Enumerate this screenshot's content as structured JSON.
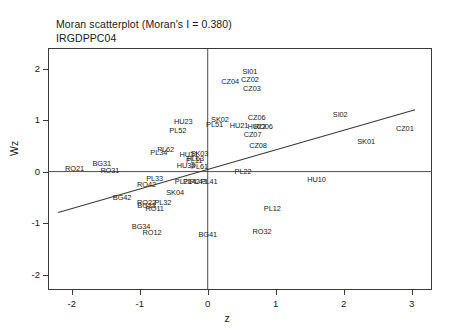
{
  "title": {
    "main": "Moran scatterplot (Moran's I = 0.380)",
    "sub": "IRGDPPC04"
  },
  "axes": {
    "xlabel": "z",
    "ylabel": "Wz",
    "xticks": [
      "-2",
      "-1",
      "0",
      "1",
      "2",
      "3"
    ],
    "yticks": [
      "-2",
      "-1",
      "0",
      "1",
      "2"
    ],
    "xlim": [
      -2.35,
      3.3
    ],
    "ylim": [
      -2.3,
      2.4
    ]
  },
  "chart_data": {
    "type": "scatter",
    "title": "Moran scatterplot (Moran's I = 0.380)",
    "subtitle": "IRGDPPC04",
    "xlabel": "z",
    "ylabel": "Wz",
    "xlim": [
      -2.35,
      3.3
    ],
    "ylim": [
      -2.3,
      2.4
    ],
    "grid": false,
    "morans_i": 0.38,
    "reference_lines": {
      "vertical_x": 0,
      "horizontal_y": 0
    },
    "regression_line": {
      "slope": 0.38,
      "intercept": 0.04,
      "x_from": -2.2,
      "x_to": 3.05
    },
    "points": [
      {
        "label": "SI01",
        "x": 0.62,
        "y": 1.93
      },
      {
        "label": "CZ02",
        "x": 0.62,
        "y": 1.78
      },
      {
        "label": "CZ04",
        "x": 0.33,
        "y": 1.74
      },
      {
        "label": "CZ03",
        "x": 0.65,
        "y": 1.6
      },
      {
        "label": "SI02",
        "x": 1.95,
        "y": 1.1
      },
      {
        "label": "CZ06",
        "x": 0.72,
        "y": 1.04
      },
      {
        "label": "SK02",
        "x": 0.18,
        "y": 1.0
      },
      {
        "label": "HU23",
        "x": -0.36,
        "y": 0.97
      },
      {
        "label": "PL51",
        "x": 0.1,
        "y": 0.9
      },
      {
        "label": "HU21",
        "x": 0.46,
        "y": 0.88
      },
      {
        "label": "HU22",
        "x": 0.72,
        "y": 0.86
      },
      {
        "label": "RO06",
        "x": 0.82,
        "y": 0.86
      },
      {
        "label": "CZ01",
        "x": 2.9,
        "y": 0.82
      },
      {
        "label": "PL52",
        "x": -0.44,
        "y": 0.78
      },
      {
        "label": "CZ07",
        "x": 0.66,
        "y": 0.72
      },
      {
        "label": "SK01",
        "x": 2.33,
        "y": 0.58
      },
      {
        "label": "CZ08",
        "x": 0.74,
        "y": 0.5
      },
      {
        "label": "PL62",
        "x": -0.62,
        "y": 0.42
      },
      {
        "label": "PL34",
        "x": -0.72,
        "y": 0.36
      },
      {
        "label": "SK03",
        "x": -0.12,
        "y": 0.34
      },
      {
        "label": "HU31",
        "x": -0.28,
        "y": 0.33
      },
      {
        "label": "PL63",
        "x": -0.18,
        "y": 0.25
      },
      {
        "label": "PL11",
        "x": -0.2,
        "y": 0.2
      },
      {
        "label": "BG31",
        "x": -1.56,
        "y": 0.15
      },
      {
        "label": "HU33",
        "x": -0.32,
        "y": 0.1
      },
      {
        "label": "PL61",
        "x": -0.12,
        "y": 0.09
      },
      {
        "label": "RO21",
        "x": -1.96,
        "y": 0.05
      },
      {
        "label": "RO31",
        "x": -1.44,
        "y": 0.02
      },
      {
        "label": "PL22",
        "x": 0.52,
        "y": 0.0
      },
      {
        "label": "PL33",
        "x": -0.78,
        "y": -0.14
      },
      {
        "label": "PL21",
        "x": -0.36,
        "y": -0.2
      },
      {
        "label": "PL43",
        "x": -0.14,
        "y": -0.21
      },
      {
        "label": "PL41",
        "x": 0.02,
        "y": -0.21
      },
      {
        "label": "PL42",
        "x": -0.24,
        "y": -0.21
      },
      {
        "label": "HU10",
        "x": 1.6,
        "y": -0.16
      },
      {
        "label": "RO42",
        "x": -0.9,
        "y": -0.26
      },
      {
        "label": "SK04",
        "x": -0.48,
        "y": -0.42
      },
      {
        "label": "BG42",
        "x": -1.26,
        "y": -0.52
      },
      {
        "label": "RO22",
        "x": -0.9,
        "y": -0.62
      },
      {
        "label": "BG33",
        "x": -0.9,
        "y": -0.66
      },
      {
        "label": "PL32",
        "x": -0.66,
        "y": -0.62
      },
      {
        "label": "PL12",
        "x": 0.95,
        "y": -0.72
      },
      {
        "label": "RO11",
        "x": -0.78,
        "y": -0.72
      },
      {
        "label": "BG34",
        "x": -0.98,
        "y": -1.08
      },
      {
        "label": "RO32",
        "x": 0.8,
        "y": -1.18
      },
      {
        "label": "RO12",
        "x": -0.82,
        "y": -1.2
      },
      {
        "label": "BG41",
        "x": 0.0,
        "y": -1.24
      }
    ]
  }
}
